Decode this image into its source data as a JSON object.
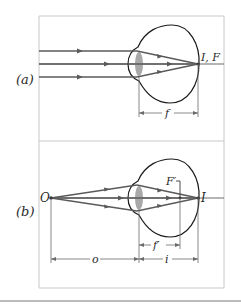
{
  "figure": {
    "panel_a": {
      "label": "(a)",
      "image_label": "I, F",
      "dimension_label": "f"
    },
    "panel_b": {
      "label": "(b)",
      "object_label": "O",
      "image_label": "I",
      "focal_label": "F′",
      "focal_dimension_label": "f′",
      "object_distance_label": "o",
      "image_distance_label": "i"
    }
  },
  "colors": {
    "ray": "#5a5a5a",
    "eye_outline": "#1a1a1a",
    "lens": "#a9a9a9",
    "panel_border": "#c8c8c8",
    "dimension": "#6a6a6a"
  }
}
